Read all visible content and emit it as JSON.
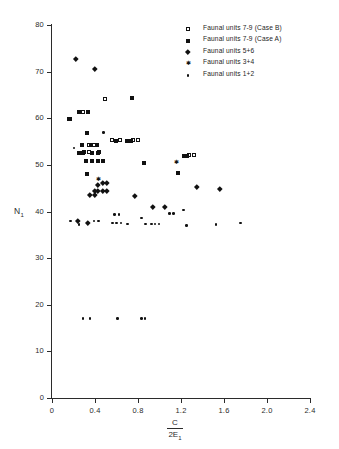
{
  "chart_data": {
    "type": "scatter",
    "title": "",
    "subtitle": "",
    "xlabel": "C / 2E1",
    "xlabel_numerator": "C",
    "xlabel_denominator": "2E",
    "xlabel_denominator_sub": "1",
    "ylabel": "N",
    "ylabel_sub": "1",
    "xlim": [
      0,
      2.4
    ],
    "ylim": [
      0,
      80
    ],
    "xticks": [
      "0",
      "0.4",
      "0.8",
      "1.2",
      "1.6",
      "2.0",
      "2.4"
    ],
    "xtick_values": [
      0,
      0.4,
      0.8,
      1.2,
      1.6,
      2.0,
      2.4
    ],
    "yticks": [
      "0",
      "10",
      "20",
      "30",
      "40",
      "50",
      "60",
      "70",
      "80"
    ],
    "ytick_values": [
      0,
      10,
      20,
      30,
      40,
      50,
      60,
      70,
      80
    ],
    "grid": false,
    "legend_position": "top-right",
    "marker_color": "#111111",
    "axis_color": "#2b2b2b",
    "background": "#ffffff",
    "series": [
      {
        "name": "Faunal units 7-9 (Case B)",
        "marker": "open-square",
        "points": [
          [
            0.175,
            59.8
          ],
          [
            0.295,
            61.3
          ],
          [
            0.5,
            64.0
          ],
          [
            0.345,
            54.2
          ],
          [
            0.395,
            54.2
          ],
          [
            0.305,
            52.6
          ],
          [
            0.345,
            52.6
          ],
          [
            0.445,
            52.6
          ],
          [
            0.565,
            55.2
          ],
          [
            0.635,
            55.2
          ],
          [
            0.755,
            55.2
          ],
          [
            0.805,
            55.2
          ],
          [
            1.275,
            52.0
          ],
          [
            1.325,
            52.0
          ]
        ]
      },
      {
        "name": "Faunal units 7-9 (Case A)",
        "marker": "filled-square",
        "points": [
          [
            0.155,
            59.8
          ],
          [
            0.255,
            61.3
          ],
          [
            0.335,
            61.3
          ],
          [
            0.745,
            64.3
          ],
          [
            0.255,
            52.6
          ],
          [
            0.285,
            52.6
          ],
          [
            0.375,
            52.6
          ],
          [
            0.425,
            52.6
          ],
          [
            0.275,
            54.2
          ],
          [
            0.365,
            54.2
          ],
          [
            0.415,
            54.2
          ],
          [
            0.595,
            55.2
          ],
          [
            0.695,
            55.2
          ],
          [
            0.735,
            55.2
          ],
          [
            0.315,
            50.8
          ],
          [
            0.375,
            50.8
          ],
          [
            0.425,
            50.8
          ],
          [
            0.475,
            50.8
          ],
          [
            0.855,
            50.3
          ],
          [
            1.225,
            52.0
          ],
          [
            1.255,
            52.0
          ],
          [
            1.175,
            48.2
          ],
          [
            0.325,
            48.0
          ],
          [
            0.325,
            56.8
          ]
        ]
      },
      {
        "name": "Faunal units 5+6",
        "marker": "diamond",
        "points": [
          [
            0.225,
            72.8
          ],
          [
            0.4,
            70.6
          ],
          [
            0.43,
            45.8
          ],
          [
            0.47,
            46.2
          ],
          [
            0.51,
            46.2
          ],
          [
            0.395,
            44.4
          ],
          [
            0.43,
            44.4
          ],
          [
            0.47,
            44.4
          ],
          [
            0.51,
            44.4
          ],
          [
            0.355,
            43.6
          ],
          [
            0.395,
            43.6
          ],
          [
            0.24,
            38.0
          ],
          [
            0.33,
            37.6
          ],
          [
            0.77,
            43.3
          ],
          [
            1.345,
            45.3
          ],
          [
            1.565,
            44.8
          ],
          [
            0.935,
            41.0
          ],
          [
            1.045,
            41.0
          ]
        ]
      },
      {
        "name": "Faunal units 3+4",
        "marker": "star",
        "points": [
          [
            1.16,
            50.5
          ],
          [
            0.435,
            46.8
          ]
        ]
      },
      {
        "name": "Faunal units 1+2",
        "marker": "dot",
        "points": [
          [
            0.17,
            38.0
          ],
          [
            0.25,
            37.2
          ],
          [
            0.39,
            38.0
          ],
          [
            0.435,
            38.0
          ],
          [
            0.58,
            39.3
          ],
          [
            0.625,
            39.3
          ],
          [
            0.565,
            37.5
          ],
          [
            0.6,
            37.5
          ],
          [
            0.64,
            37.5
          ],
          [
            0.705,
            37.3
          ],
          [
            0.835,
            38.6
          ],
          [
            0.87,
            37.3
          ],
          [
            0.925,
            37.3
          ],
          [
            0.96,
            37.3
          ],
          [
            0.995,
            37.3
          ],
          [
            1.095,
            39.6
          ],
          [
            1.13,
            39.6
          ],
          [
            1.225,
            40.3
          ],
          [
            1.25,
            37.0
          ],
          [
            1.525,
            37.2
          ],
          [
            1.755,
            37.5
          ],
          [
            0.29,
            17.0
          ],
          [
            0.355,
            17.0
          ],
          [
            0.61,
            17.0
          ],
          [
            0.835,
            17.0
          ],
          [
            0.865,
            17.0
          ],
          [
            0.48,
            57.0
          ],
          [
            0.205,
            53.6
          ]
        ]
      }
    ]
  },
  "legend": {
    "items": [
      {
        "marker": "open-square",
        "label": "Faunal units  7-9 (Case B)"
      },
      {
        "marker": "filled-square",
        "label": "Faunal units  7-9 (Case A)"
      },
      {
        "marker": "diamond",
        "label": "Faunal units  5+6"
      },
      {
        "marker": "star",
        "label": "Faunal units  3+4"
      },
      {
        "marker": "dot",
        "label": "Faunal units  1+2"
      }
    ]
  }
}
